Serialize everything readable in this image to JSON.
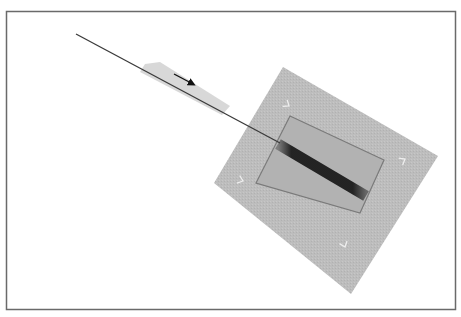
{
  "canvas": {
    "width": 461,
    "height": 317,
    "background": "#ffffff"
  },
  "frame": {
    "x": 6.5,
    "y": 11.5,
    "width": 449,
    "height": 298,
    "stroke": "#6a6a6a",
    "stroke_width": 1.5
  },
  "plate": {
    "points": "283,67 438,156 351,294 214,183",
    "fill": "#b8b8b8",
    "opacity": 0.95
  },
  "inner_rect": {
    "points": "290,116 384,160 360,213 256,183",
    "fill": "#b2b2b2",
    "stroke": "#7a7a7a",
    "stroke_width": 1.2
  },
  "band": {
    "x1": 278,
    "y1": 144,
    "x2": 366,
    "y2": 196,
    "color": "#1c1c1c",
    "width": 11
  },
  "wire": {
    "x1": 76,
    "y1": 34,
    "x2": 280,
    "y2": 143,
    "color": "#3a3a3a",
    "width": 1.3
  },
  "wire_halo": {
    "points": "145,64 160,62 230,106 222,115 140,72",
    "color": "#d4d4d4"
  },
  "arrow": {
    "x1": 174,
    "y1": 74,
    "x2": 193,
    "y2": 84,
    "color": "#111111",
    "label": "motion-direction"
  },
  "tick_marks": [
    {
      "x": 289,
      "y": 106,
      "angle": 35
    },
    {
      "x": 405,
      "y": 159,
      "angle": -30
    },
    {
      "x": 243,
      "y": 181,
      "angle": 20
    },
    {
      "x": 345,
      "y": 247,
      "angle": 70
    }
  ]
}
